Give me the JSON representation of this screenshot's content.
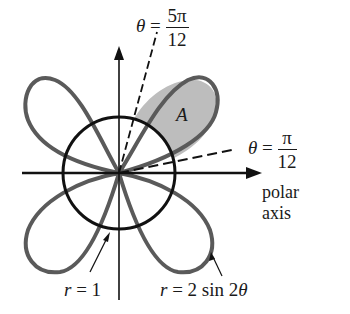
{
  "diagram": {
    "curves": [
      {
        "name": "circle",
        "equation": "r = 1"
      },
      {
        "name": "four-leaved rose",
        "equation": "r = 2 sin 2θ"
      }
    ],
    "labels": {
      "theta_top": {
        "lhs": "θ",
        "eq": "=",
        "num": "5π",
        "den": "12"
      },
      "theta_right": {
        "lhs": "θ",
        "eq": "=",
        "num": "π",
        "den": "12"
      },
      "region": "A",
      "polar_axis_line1": "polar",
      "polar_axis_line2": "axis",
      "circle_label_lhs": "r",
      "circle_label_rhs": "= 1",
      "rose_label_lhs": "r",
      "rose_label_rhs": "= 2 sin 2",
      "rose_label_theta": "θ"
    },
    "colors": {
      "ink": "#111111",
      "rose": "#5a5a5a",
      "shade": "#bdbdbd"
    }
  }
}
